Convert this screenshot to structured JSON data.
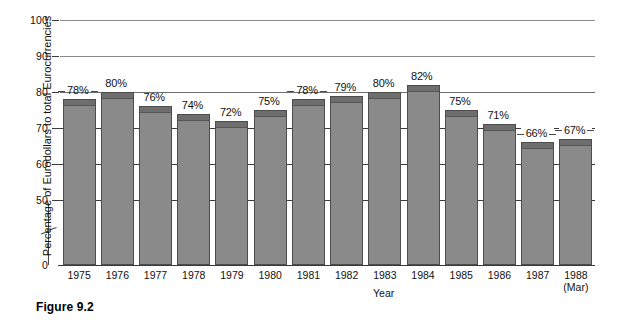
{
  "caption": "Figure 9.2",
  "chart_data": {
    "type": "bar",
    "title": "",
    "xlabel": "Year",
    "ylabel": "Percentage of Eurodollars to total Eurocurrencies",
    "categories": [
      "1975",
      "1976",
      "1977",
      "1978",
      "1979",
      "1980",
      "1981",
      "1982",
      "1983",
      "1984",
      "1985",
      "1986",
      "1987",
      "1988"
    ],
    "category_sublabels": [
      "",
      "",
      "",
      "",
      "",
      "",
      "",
      "",
      "",
      "",
      "",
      "",
      "",
      "(Mar)"
    ],
    "values": [
      78,
      80,
      76,
      74,
      72,
      75,
      78,
      79,
      80,
      82,
      75,
      71,
      66,
      67
    ],
    "value_labels": [
      "78%",
      "80%",
      "76%",
      "74%",
      "72%",
      "75%",
      "78%",
      "79%",
      "80%",
      "82%",
      "75%",
      "71%",
      "66%",
      "67%"
    ],
    "ylim": [
      0,
      100
    ],
    "yticks": [
      0,
      50,
      60,
      70,
      80,
      90,
      100
    ],
    "ytick_labels": [
      "0",
      "50",
      "60",
      "70",
      "80",
      "90",
      "100"
    ],
    "axis_break": true,
    "axis_break_between": [
      0,
      50
    ],
    "grid": true,
    "full_gridlines": [
      80,
      90,
      100
    ],
    "stub_gridlines": [
      50,
      60,
      70
    ],
    "legend": "none",
    "bar_color": "#8a8a8a",
    "bar_cap_color": "#6e6e6e",
    "bar_border_color": "#4d4d4d",
    "background_color": "#ffffff"
  }
}
